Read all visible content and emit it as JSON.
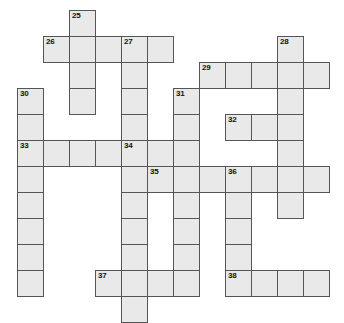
{
  "puzzle": {
    "type": "crossword-grid",
    "title": "Crossword puzzle grid",
    "cell_size": 26,
    "origin_x": 17,
    "origin_y": 10,
    "colors": {
      "cell_fill": "#e9e9e9",
      "cell_border": "#555555",
      "background": "#ffffff",
      "number_text": "#111111"
    },
    "clue_numbers": [
      25,
      26,
      27,
      28,
      29,
      30,
      31,
      32,
      33,
      34,
      35,
      36,
      37,
      38
    ],
    "entries": [
      {
        "number": "25",
        "direction": "down",
        "col": 2,
        "row": 0,
        "length": 4
      },
      {
        "number": "26",
        "direction": "across",
        "col": 1,
        "row": 1,
        "length": 5
      },
      {
        "number": "27",
        "direction": "down",
        "col": 4,
        "row": 1,
        "length": 5
      },
      {
        "number": "28",
        "direction": "down",
        "col": 10,
        "row": 1,
        "length": 8
      },
      {
        "number": "29",
        "direction": "across",
        "col": 7,
        "row": 2,
        "length": 5
      },
      {
        "number": "30",
        "direction": "down",
        "col": 0,
        "row": 3,
        "length": 8
      },
      {
        "number": "31",
        "direction": "down",
        "col": 6,
        "row": 3,
        "length": 8
      },
      {
        "number": "32",
        "direction": "across",
        "col": 8,
        "row": 4,
        "length": 3
      },
      {
        "number": "33",
        "direction": "across",
        "col": 0,
        "row": 5,
        "length": 5
      },
      {
        "number": "34",
        "direction": "down",
        "col": 4,
        "row": 5,
        "length": 7
      },
      {
        "number": "35",
        "direction": "across",
        "col": 5,
        "row": 6,
        "length": 5
      },
      {
        "number": "36",
        "direction": "down",
        "col": 8,
        "row": 6,
        "length": 5
      },
      {
        "number": "37",
        "direction": "across",
        "col": 3,
        "row": 10,
        "length": 5
      },
      {
        "number": "38",
        "direction": "across",
        "col": 8,
        "row": 10,
        "length": 4
      }
    ],
    "cells": [
      {
        "col": 2,
        "row": 0,
        "num": "25"
      },
      {
        "col": 1,
        "row": 1,
        "num": "26"
      },
      {
        "col": 2,
        "row": 1,
        "num": ""
      },
      {
        "col": 3,
        "row": 1,
        "num": ""
      },
      {
        "col": 4,
        "row": 1,
        "num": "27"
      },
      {
        "col": 5,
        "row": 1,
        "num": ""
      },
      {
        "col": 10,
        "row": 1,
        "num": "28"
      },
      {
        "col": 2,
        "row": 2,
        "num": ""
      },
      {
        "col": 4,
        "row": 2,
        "num": ""
      },
      {
        "col": 7,
        "row": 2,
        "num": "29"
      },
      {
        "col": 8,
        "row": 2,
        "num": ""
      },
      {
        "col": 9,
        "row": 2,
        "num": ""
      },
      {
        "col": 10,
        "row": 2,
        "num": ""
      },
      {
        "col": 11,
        "row": 2,
        "num": ""
      },
      {
        "col": 0,
        "row": 3,
        "num": "30"
      },
      {
        "col": 2,
        "row": 3,
        "num": ""
      },
      {
        "col": 4,
        "row": 3,
        "num": ""
      },
      {
        "col": 6,
        "row": 3,
        "num": "31"
      },
      {
        "col": 10,
        "row": 3,
        "num": ""
      },
      {
        "col": 0,
        "row": 4,
        "num": ""
      },
      {
        "col": 4,
        "row": 4,
        "num": ""
      },
      {
        "col": 6,
        "row": 4,
        "num": ""
      },
      {
        "col": 8,
        "row": 4,
        "num": "32"
      },
      {
        "col": 9,
        "row": 4,
        "num": ""
      },
      {
        "col": 10,
        "row": 4,
        "num": ""
      },
      {
        "col": 0,
        "row": 5,
        "num": "33"
      },
      {
        "col": 1,
        "row": 5,
        "num": ""
      },
      {
        "col": 2,
        "row": 5,
        "num": ""
      },
      {
        "col": 3,
        "row": 5,
        "num": ""
      },
      {
        "col": 4,
        "row": 5,
        "num": "34"
      },
      {
        "col": 5,
        "row": 5,
        "num": ""
      },
      {
        "col": 6,
        "row": 5,
        "num": ""
      },
      {
        "col": 10,
        "row": 5,
        "num": ""
      },
      {
        "col": 0,
        "row": 6,
        "num": ""
      },
      {
        "col": 4,
        "row": 6,
        "num": ""
      },
      {
        "col": 5,
        "row": 6,
        "num": "35"
      },
      {
        "col": 6,
        "row": 6,
        "num": ""
      },
      {
        "col": 7,
        "row": 6,
        "num": ""
      },
      {
        "col": 8,
        "row": 6,
        "num": "36"
      },
      {
        "col": 9,
        "row": 6,
        "num": ""
      },
      {
        "col": 10,
        "row": 6,
        "num": ""
      },
      {
        "col": 11,
        "row": 6,
        "num": ""
      },
      {
        "col": 0,
        "row": 7,
        "num": ""
      },
      {
        "col": 4,
        "row": 7,
        "num": ""
      },
      {
        "col": 6,
        "row": 7,
        "num": ""
      },
      {
        "col": 8,
        "row": 7,
        "num": ""
      },
      {
        "col": 10,
        "row": 7,
        "num": ""
      },
      {
        "col": 0,
        "row": 8,
        "num": ""
      },
      {
        "col": 4,
        "row": 8,
        "num": ""
      },
      {
        "col": 6,
        "row": 8,
        "num": ""
      },
      {
        "col": 8,
        "row": 8,
        "num": ""
      },
      {
        "col": 0,
        "row": 9,
        "num": ""
      },
      {
        "col": 4,
        "row": 9,
        "num": ""
      },
      {
        "col": 6,
        "row": 9,
        "num": ""
      },
      {
        "col": 8,
        "row": 9,
        "num": ""
      },
      {
        "col": 0,
        "row": 10,
        "num": ""
      },
      {
        "col": 3,
        "row": 10,
        "num": "37"
      },
      {
        "col": 4,
        "row": 10,
        "num": ""
      },
      {
        "col": 5,
        "row": 10,
        "num": ""
      },
      {
        "col": 6,
        "row": 10,
        "num": ""
      },
      {
        "col": 8,
        "row": 10,
        "num": "38"
      },
      {
        "col": 9,
        "row": 10,
        "num": ""
      },
      {
        "col": 10,
        "row": 10,
        "num": ""
      },
      {
        "col": 11,
        "row": 10,
        "num": ""
      },
      {
        "col": 4,
        "row": 11,
        "num": ""
      }
    ]
  }
}
